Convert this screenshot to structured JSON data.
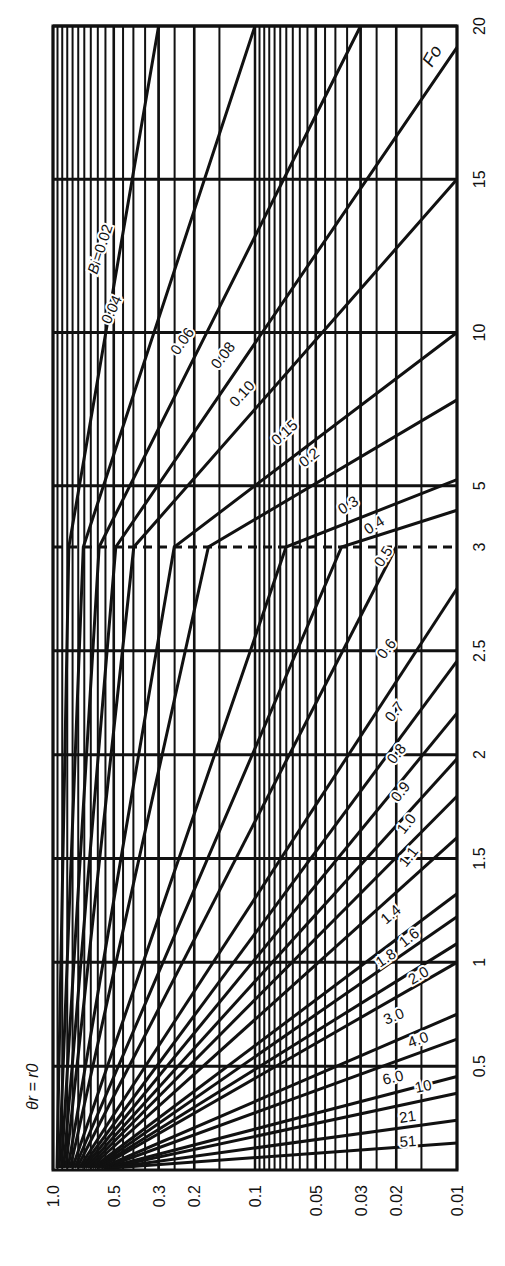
{
  "chart_data": {
    "type": "line",
    "title": "",
    "orientation": "rotated 90 degrees (x-axis runs along bottom edge vertically labelled, Fo axis along right edge)",
    "corner_label": "θr = r0",
    "xlabel": "θ (log scale)",
    "ylabel": "Fo",
    "x_ticks": [
      "1.0",
      "0.5",
      "0.3",
      "0.2",
      "0.1",
      "0.05",
      "0.03",
      "0.02",
      "0.01"
    ],
    "x_tick_values": [
      1.0,
      0.5,
      0.3,
      0.2,
      0.1,
      0.05,
      0.03,
      0.02,
      0.01
    ],
    "xlim": [
      1.0,
      0.01
    ],
    "x_scale": "log",
    "y_ticks": [
      "0.5",
      "1",
      "1.5",
      "2",
      "2.5",
      "3",
      "5",
      "10",
      "15",
      "20"
    ],
    "y_tick_values": [
      0.5,
      1,
      1.5,
      2,
      2.5,
      3,
      5,
      10,
      15,
      20
    ],
    "ylim": [
      0,
      20
    ],
    "y_scale_note": "piecewise linear: 0–3 expanded, 3–20 compressed; dashed line at Fo = 3",
    "grid": true,
    "series_param": "Bi",
    "series": [
      {
        "name": "Bi=0.02",
        "end_theta": 0.3,
        "end_fo": 20
      },
      {
        "name": "0.04",
        "end_theta": 0.1,
        "end_fo": 20
      },
      {
        "name": "0.06",
        "end_theta": 0.03,
        "end_fo": 20
      },
      {
        "name": "0.08",
        "end_theta": 0.01,
        "end_fo": 19.3
      },
      {
        "name": "0.10",
        "end_theta": 0.01,
        "end_fo": 15
      },
      {
        "name": "0.15",
        "end_theta": 0.01,
        "end_fo": 10
      },
      {
        "name": "0.2",
        "end_theta": 0.01,
        "end_fo": 7.8
      },
      {
        "name": "0.3",
        "end_theta": 0.01,
        "end_fo": 5.2
      },
      {
        "name": "0.4",
        "end_theta": 0.01,
        "end_fo": 4.2
      },
      {
        "name": "0.5",
        "end_theta": 0.02,
        "end_fo": 3.0
      },
      {
        "name": "0.6",
        "end_theta": 0.01,
        "end_fo": 2.8
      },
      {
        "name": "0.7",
        "end_theta": 0.01,
        "end_fo": 2.45
      },
      {
        "name": "0.8",
        "end_theta": 0.01,
        "end_fo": 2.2
      },
      {
        "name": "0.9",
        "end_theta": 0.01,
        "end_fo": 1.98
      },
      {
        "name": "1.0",
        "end_theta": 0.01,
        "end_fo": 1.8
      },
      {
        "name": "1.1",
        "end_theta": 0.01,
        "end_fo": 1.6
      },
      {
        "name": "1.4",
        "end_theta": 0.01,
        "end_fo": 1.33
      },
      {
        "name": "1.6",
        "end_theta": 0.01,
        "end_fo": 1.22
      },
      {
        "name": "1.8",
        "end_theta": 0.01,
        "end_fo": 1.09
      },
      {
        "name": "2.0",
        "end_theta": 0.01,
        "end_fo": 1.0
      },
      {
        "name": "3.0",
        "end_theta": 0.01,
        "end_fo": 0.75
      },
      {
        "name": "4.0",
        "end_theta": 0.01,
        "end_fo": 0.63
      },
      {
        "name": "6.0",
        "end_theta": 0.01,
        "end_fo": 0.45
      },
      {
        "name": "10",
        "end_theta": 0.01,
        "end_fo": 0.37
      },
      {
        "name": "21",
        "end_theta": 0.01,
        "end_fo": 0.24
      },
      {
        "name": "51",
        "end_theta": 0.01,
        "end_fo": 0.13
      }
    ],
    "fo_axis_label": "Fo"
  }
}
